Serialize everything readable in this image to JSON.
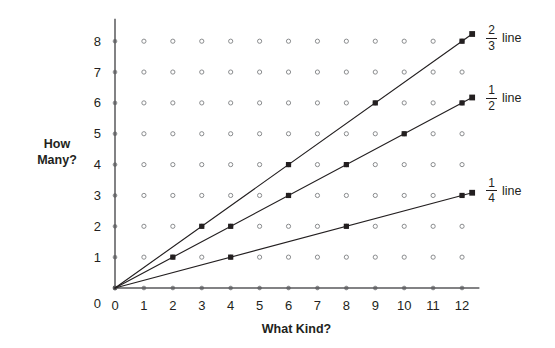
{
  "chart_data": {
    "type": "line",
    "title": "",
    "xlabel": "What Kind?",
    "ylabel": "How Many?",
    "xlim": [
      0,
      12.6
    ],
    "ylim": [
      0,
      8.6
    ],
    "xticks": [
      0,
      1,
      2,
      3,
      4,
      5,
      6,
      7,
      8,
      9,
      10,
      11,
      12
    ],
    "yticks": [
      0,
      1,
      2,
      3,
      4,
      5,
      6,
      7,
      8
    ],
    "xtick_labels": [
      "0",
      "1",
      "2",
      "3",
      "4",
      "5",
      "6",
      "7",
      "8",
      "9",
      "10",
      "11",
      "12"
    ],
    "ytick_labels": [
      "0",
      "1",
      "2",
      "3",
      "4",
      "5",
      "6",
      "7",
      "8"
    ],
    "grid": "lattice-dots",
    "grid_dot_style": "open-circle",
    "legend_position": "right-end-of-line",
    "marker": "filled-square",
    "series": [
      {
        "name": "2/3 line",
        "numerator": "2",
        "denominator": "3",
        "word": "line",
        "slope": 0.6666667,
        "color": "#231f20",
        "x": [
          0,
          3,
          6,
          9,
          12
        ],
        "y": [
          0,
          2,
          4,
          6,
          8
        ],
        "marker_points": [
          [
            0,
            0
          ],
          [
            3,
            2
          ],
          [
            6,
            4
          ],
          [
            9,
            6
          ],
          [
            12,
            8
          ]
        ],
        "label_x": 12.9,
        "label_y": 8.45
      },
      {
        "name": "1/2 line",
        "numerator": "1",
        "denominator": "2",
        "word": "line",
        "slope": 0.5,
        "color": "#231f20",
        "x": [
          0,
          2,
          4,
          6,
          8,
          10,
          12
        ],
        "y": [
          0,
          1,
          2,
          3,
          4,
          5,
          6
        ],
        "marker_points": [
          [
            0,
            0
          ],
          [
            2,
            1
          ],
          [
            4,
            2
          ],
          [
            6,
            3
          ],
          [
            8,
            4
          ],
          [
            10,
            5
          ],
          [
            12,
            6
          ]
        ],
        "label_x": 12.9,
        "label_y": 6.5
      },
      {
        "name": "1/4 line",
        "numerator": "1",
        "denominator": "4",
        "word": "line",
        "slope": 0.25,
        "color": "#231f20",
        "x": [
          0,
          4,
          8,
          12
        ],
        "y": [
          0,
          1,
          2,
          3
        ],
        "marker_points": [
          [
            0,
            0
          ],
          [
            4,
            1
          ],
          [
            8,
            2
          ],
          [
            12,
            3
          ]
        ],
        "label_x": 12.9,
        "label_y": 3.5
      }
    ]
  },
  "axes": {
    "x_title": "What Kind?",
    "y_title": "How Many?"
  },
  "colors": {
    "ink": "#231f20",
    "axis": "#58595b",
    "grid_dot": "#8a8c8e",
    "background": "#ffffff"
  }
}
